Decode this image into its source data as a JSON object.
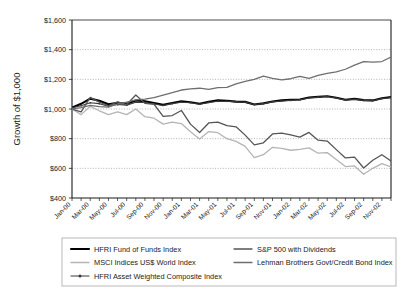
{
  "chart_data": {
    "type": "line",
    "title": "",
    "xlabel": "",
    "ylabel": "Growth of $1,000",
    "ylim": [
      400,
      1600
    ],
    "yticks": [
      400,
      600,
      800,
      1000,
      1200,
      1400,
      1600
    ],
    "ytick_labels": [
      "$400",
      "$600",
      "$800",
      "$1,000",
      "$1,200",
      "$1,400",
      "$1,600"
    ],
    "grid": true,
    "grid_style": "dotted-horizontal",
    "legend_position": "bottom",
    "x": [
      "Jan-00",
      "Feb-00",
      "Mar-00",
      "Apr-00",
      "May-00",
      "Jun-00",
      "Jul-00",
      "Aug-00",
      "Sep-00",
      "Oct-00",
      "Nov-00",
      "Dec-00",
      "Jan-01",
      "Feb-01",
      "Mar-01",
      "Apr-01",
      "May-01",
      "Jun-01",
      "Jul-01",
      "Aug-01",
      "Sep-01",
      "Oct-01",
      "Nov-01",
      "Dec-01",
      "Jan-02",
      "Feb-02",
      "Mar-02",
      "Apr-02",
      "May-02",
      "Jun-02",
      "Jul-02",
      "Aug-02",
      "Sep-02",
      "Oct-02",
      "Nov-02",
      "Dec-02"
    ],
    "xtick_labels": [
      "Jan-00",
      "Mar-00",
      "May-00",
      "Jul-00",
      "Sep-00",
      "Nov-00",
      "Jan-01",
      "Mar-01",
      "May-01",
      "Jul-01",
      "Sep-01",
      "Nov-01",
      "Jan-02",
      "Mar-02",
      "May-02",
      "Jul-02",
      "Sep-02",
      "Nov-02"
    ],
    "xtick_label_every": 2,
    "series": [
      {
        "name": "HFRI Fund of Funds Index",
        "color": "#000000",
        "width": 2.1,
        "marker": "none",
        "values": [
          1010,
          1035,
          1070,
          1055,
          1032,
          1042,
          1036,
          1058,
          1052,
          1040,
          1028,
          1040,
          1052,
          1046,
          1035,
          1048,
          1058,
          1056,
          1050,
          1048,
          1030,
          1038,
          1050,
          1058,
          1062,
          1064,
          1078,
          1082,
          1086,
          1076,
          1062,
          1068,
          1060,
          1058,
          1072,
          1080
        ]
      },
      {
        "name": "MSCI Indices US$ World Index",
        "color": "#b4b4b4",
        "width": 1.3,
        "marker": "none",
        "values": [
          1000,
          962,
          1018,
          988,
          962,
          980,
          962,
          1000,
          948,
          938,
          898,
          912,
          902,
          846,
          798,
          848,
          840,
          800,
          782,
          748,
          672,
          692,
          742,
          734,
          722,
          728,
          738,
          702,
          706,
          660,
          612,
          616,
          560,
          600,
          632,
          610
        ]
      },
      {
        "name": "HFRI Asset Weighted Composite Index",
        "color": "#3a3a3a",
        "width": 1.1,
        "marker": "dot",
        "values": [
          1008,
          1022,
          1042,
          1036,
          1018,
          1030,
          1026,
          1046,
          1044,
          1034,
          1024,
          1036,
          1046,
          1042,
          1032,
          1044,
          1052,
          1052,
          1048,
          1046,
          1030,
          1036,
          1048,
          1054,
          1058,
          1062,
          1074,
          1080,
          1084,
          1074,
          1060,
          1066,
          1058,
          1056,
          1070,
          1078
        ]
      },
      {
        "name": "S&P 500 with Dividends",
        "color": "#555555",
        "width": 1.3,
        "marker": "none",
        "values": [
          1000,
          980,
          1078,
          1046,
          1022,
          1048,
          1030,
          1094,
          1038,
          1032,
          950,
          956,
          990,
          898,
          842,
          906,
          912,
          888,
          880,
          824,
          758,
          772,
          832,
          838,
          826,
          810,
          842,
          790,
          784,
          726,
          670,
          676,
          602,
          654,
          692,
          650
        ]
      },
      {
        "name": "Lehman Brothers Govt/Credit Bond Index",
        "color": "#6e6e6e",
        "width": 1.3,
        "marker": "none",
        "values": [
          1000,
          1010,
          1024,
          1016,
          1012,
          1034,
          1046,
          1062,
          1066,
          1076,
          1094,
          1110,
          1128,
          1136,
          1140,
          1132,
          1144,
          1146,
          1170,
          1186,
          1200,
          1222,
          1206,
          1196,
          1204,
          1220,
          1206,
          1226,
          1240,
          1250,
          1268,
          1296,
          1320,
          1316,
          1320,
          1350
        ]
      }
    ]
  },
  "legend": {
    "items": [
      {
        "label": "HFRI Fund of Funds Index"
      },
      {
        "label": "MSCI Indices US$ World Index"
      },
      {
        "label": "HFRI Asset Weighted Composite Index"
      },
      {
        "label": "S&P 500 with Dividends"
      },
      {
        "label": "Lehman Brothers Govt/Credit Bond Index"
      }
    ]
  }
}
